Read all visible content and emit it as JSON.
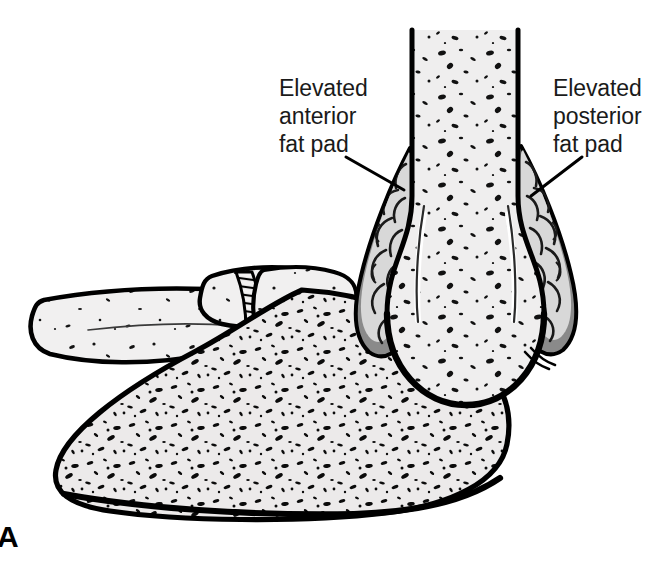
{
  "figure": {
    "panel_letter": "A",
    "background_color": "#ffffff",
    "ink_color": "#000000",
    "bone_fill_color": "#e8e8e8",
    "fat_pad_band_color": "#8a8a8a",
    "fat_pad_lobule_color": "#d6d6d6",
    "width": 657,
    "height": 562
  },
  "labels": {
    "anterior": {
      "text": "Elevated\nanterior\nfat pad",
      "line1": "Elevated",
      "line2": "anterior",
      "line3": "fat pad"
    },
    "posterior": {
      "text": "Elevated\nposterior\nfat pad",
      "line1": "Elevated",
      "line2": "posterior",
      "line3": "fat pad"
    }
  },
  "structures": [
    {
      "name": "humerus-shaft",
      "description": "distal humerus shaft with trabecular speckle"
    },
    {
      "name": "distal-humerus-bulb",
      "description": "flared distal humeral metaphysis"
    },
    {
      "name": "anterior-fat-pad",
      "description": "elevated anterior fat pad, lobulated"
    },
    {
      "name": "posterior-fat-pad",
      "description": "elevated posterior fat pad, lobulated"
    },
    {
      "name": "olecranon",
      "description": "olecranon of ulna with hatched physis"
    },
    {
      "name": "ulna",
      "description": "proximal ulna with dense trabecular pattern"
    },
    {
      "name": "radius",
      "description": "radial neck and shaft extending left"
    }
  ]
}
